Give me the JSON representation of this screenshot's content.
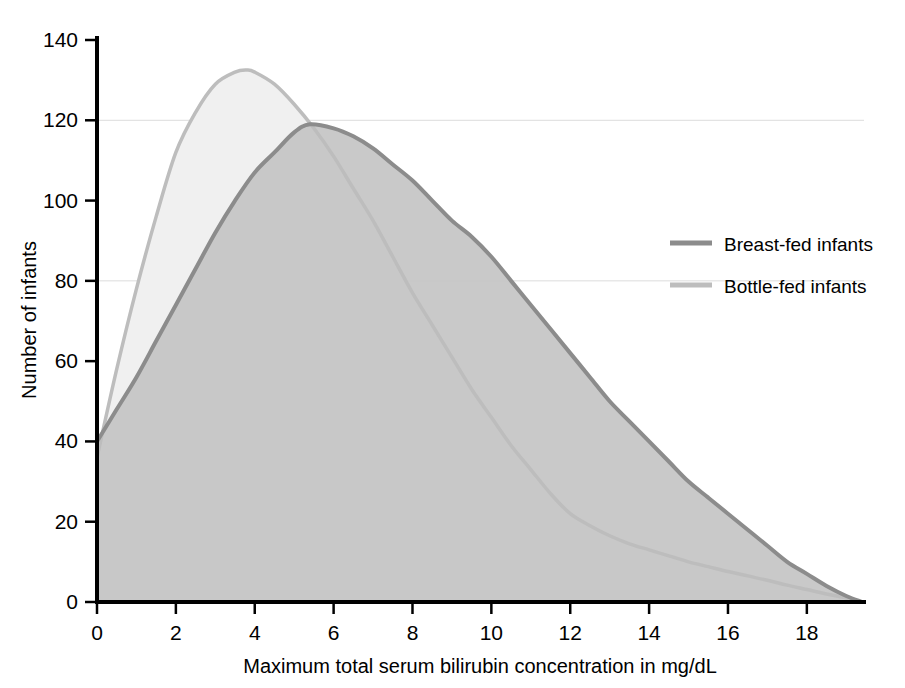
{
  "chart_data": {
    "type": "area",
    "title": "",
    "xlabel": "Maximum total serum bilirubin concentration in mg/dL",
    "ylabel": "Number of infants",
    "xlim": [
      0,
      19.5
    ],
    "ylim": [
      0,
      140
    ],
    "xticks": [
      0,
      2,
      4,
      6,
      8,
      10,
      12,
      14,
      16,
      18
    ],
    "yticks": [
      0,
      20,
      40,
      60,
      80,
      100,
      120,
      140
    ],
    "xtick_labels": [
      "0",
      "2",
      "4",
      "6",
      "8",
      "10",
      "12",
      "14",
      "16",
      "18"
    ],
    "ytick_labels": [
      "0",
      "20",
      "40",
      "60",
      "80",
      "100",
      "120",
      "140"
    ],
    "grid": "horizontal-faint",
    "gridlines_y": [
      80,
      120
    ],
    "legend_position": "right-upper",
    "series": [
      {
        "name": "Breast-fed infants",
        "color": "#8c8c8c",
        "fill": "#c4c4c4",
        "peak_x": 5.4,
        "peak_y": 119,
        "x": [
          0,
          0.5,
          1,
          1.5,
          2,
          2.5,
          3,
          3.5,
          4,
          4.5,
          5,
          5.4,
          6,
          6.5,
          7,
          7.5,
          8,
          8.5,
          9,
          9.5,
          10,
          10.5,
          11,
          11.5,
          12,
          12.5,
          13,
          13.5,
          14,
          14.5,
          15,
          15.5,
          16,
          16.5,
          17,
          17.5,
          18,
          18.5,
          19,
          19.4
        ],
        "values": [
          40,
          48,
          56,
          65,
          74,
          83,
          92,
          100,
          107,
          112,
          117,
          119,
          118,
          116,
          113,
          109,
          105,
          100,
          95,
          91,
          86,
          80,
          74,
          68,
          62,
          56,
          50,
          45,
          40,
          35,
          30,
          26,
          22,
          18,
          14,
          10,
          7,
          4,
          1.5,
          0
        ]
      },
      {
        "name": "Bottle-fed infants",
        "color": "#bdbdbd",
        "fill": "#f0f0f0",
        "peak_x": 3.8,
        "peak_y": 132,
        "x": [
          0,
          0.5,
          1,
          1.5,
          2,
          2.5,
          3,
          3.5,
          3.8,
          4,
          4.5,
          5,
          5.5,
          6,
          6.5,
          7,
          7.5,
          8,
          8.5,
          9,
          9.5,
          10,
          10.5,
          11,
          11.5,
          12,
          12.5,
          13,
          13.5,
          14,
          14.5,
          15,
          15.5,
          16,
          16.5,
          17,
          17.5,
          18,
          18.5,
          19,
          19.4
        ],
        "values": [
          36,
          58,
          78,
          96,
          112,
          122,
          129,
          132,
          132.5,
          132,
          129,
          124,
          118,
          111,
          103,
          95,
          86,
          77,
          69,
          61,
          53,
          46,
          39,
          33,
          27,
          22,
          19,
          16.5,
          14.5,
          13,
          11.5,
          10,
          8.8,
          7.6,
          6.5,
          5.4,
          4.2,
          3.1,
          2,
          1,
          0
        ]
      }
    ]
  },
  "legend": {
    "entries": [
      {
        "label": "Breast-fed infants",
        "color": "#8c8c8c"
      },
      {
        "label": "Bottle-fed infants",
        "color": "#bdbdbd"
      }
    ]
  },
  "axes": {
    "x_title": "Maximum total serum bilirubin concentration in mg/dL",
    "y_title": "Number of infants"
  }
}
